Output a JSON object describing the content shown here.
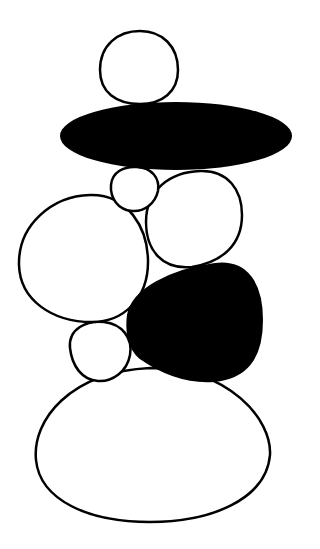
{
  "figure": {
    "width": 320,
    "height": 549,
    "colors": {
      "background": "#ffffff",
      "stroke": "#000000",
      "fill_dark": "#000000",
      "fill_light": "#ffffff"
    },
    "stones": [
      {
        "id": "top-stone",
        "fill": "light"
      },
      {
        "id": "flat-dark-stone",
        "fill": "dark"
      },
      {
        "id": "small-stone",
        "fill": "light"
      },
      {
        "id": "right-upper-stone",
        "fill": "light"
      },
      {
        "id": "left-large-stone",
        "fill": "light"
      },
      {
        "id": "dark-triangular-stone",
        "fill": "dark"
      },
      {
        "id": "small-lower-stone",
        "fill": "light"
      },
      {
        "id": "base-stone",
        "fill": "light"
      }
    ]
  }
}
